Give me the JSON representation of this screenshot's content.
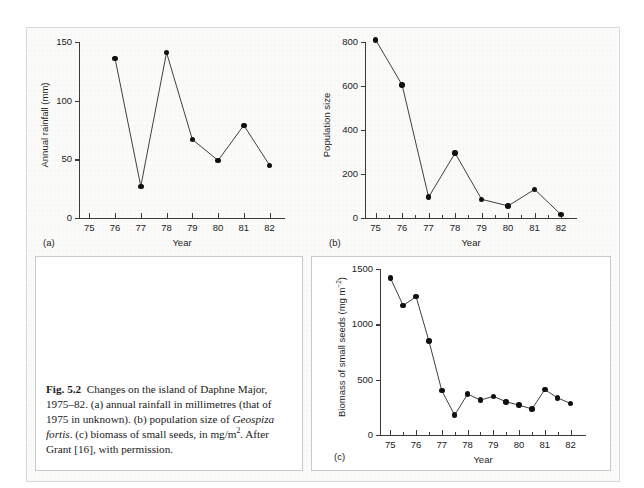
{
  "figure": {
    "label": "Fig. 5.2",
    "caption_segments": {
      "before_italic": "Changes on the island of Daphne Major, 1975–82. (a) annual rainfall in millimetres (that of 1975 in unknown). (b) population size of ",
      "italic": "Geospiza fortis",
      "after_italic_a": ". (c) biomass of small seeds, in mg/m",
      "superscript": "2",
      "after_italic_b": ". After Grant [16], with permission."
    }
  },
  "panels": {
    "a": {
      "letter": "(a)",
      "ylabel": "Annual rainfall (mm)",
      "xlabel": "Year"
    },
    "b": {
      "letter": "(b)",
      "ylabel": "Population size",
      "xlabel": "Year"
    },
    "c": {
      "letter": "(c)",
      "ylabel_text": "Biomass of small seeds (mg m",
      "ylabel_sup": "−2",
      "ylabel_tail": ")",
      "xlabel": "Year"
    }
  },
  "chart_data": [
    {
      "id": "panel-a",
      "type": "line",
      "title": "(a) Annual rainfall",
      "xlabel": "Year",
      "ylabel": "Annual rainfall (mm)",
      "xlim": [
        74.6,
        82.6
      ],
      "ylim": [
        0,
        150
      ],
      "yticks": [
        0,
        50,
        100,
        150
      ],
      "ytick_labels": [
        "0",
        "50",
        "100",
        "150"
      ],
      "xticks": [
        75,
        76,
        77,
        78,
        79,
        80,
        81,
        82
      ],
      "xtick_labels": [
        "75",
        "76",
        "77",
        "78",
        "79",
        "80",
        "81",
        "82"
      ],
      "minor_xticks": false,
      "grid": false,
      "legend": "none",
      "marker": "filled-circle",
      "note": "no data point for 1975 (unknown)",
      "x": [
        76,
        77,
        78,
        79,
        80,
        81,
        82
      ],
      "values": [
        136,
        27,
        141,
        67,
        49,
        79,
        45
      ]
    },
    {
      "id": "panel-b",
      "type": "line",
      "title": "(b) Population size of Geospiza fortis",
      "xlabel": "Year",
      "ylabel": "Population size",
      "xlim": [
        74.6,
        82.6
      ],
      "ylim": [
        0,
        800
      ],
      "yticks": [
        0,
        200,
        400,
        600,
        800
      ],
      "ytick_labels": [
        "0",
        "200",
        "400",
        "600",
        "800"
      ],
      "xticks": [
        75,
        76,
        77,
        78,
        79,
        80,
        81,
        82
      ],
      "xtick_labels": [
        "75",
        "76",
        "77",
        "78",
        "79",
        "80",
        "81",
        "82"
      ],
      "minor_xticks": true,
      "grid": false,
      "legend": "none",
      "marker": "filled-circle",
      "x": [
        75,
        76,
        77,
        78,
        79,
        80,
        81,
        82
      ],
      "values": [
        810,
        605,
        95,
        295,
        85,
        55,
        130,
        15
      ]
    },
    {
      "id": "panel-c",
      "type": "line",
      "title": "(c) Biomass of small seeds",
      "xlabel": "Year",
      "ylabel": "Biomass of small seeds (mg m−2)",
      "xlim": [
        74.6,
        82.6
      ],
      "ylim": [
        0,
        1500
      ],
      "yticks": [
        0,
        500,
        1000,
        1500
      ],
      "ytick_labels": [
        "0",
        "500",
        "1000",
        "1500"
      ],
      "xticks": [
        75,
        76,
        77,
        78,
        79,
        80,
        81,
        82
      ],
      "xtick_labels": [
        "75",
        "76",
        "77",
        "78",
        "79",
        "80",
        "81",
        "82"
      ],
      "minor_xticks": true,
      "grid": false,
      "legend": "none",
      "marker": "filled-circle",
      "x": [
        75,
        75.5,
        76,
        76.5,
        77,
        77.5,
        78,
        78.5,
        79,
        79.5,
        80,
        80.5,
        81,
        81.5,
        82
      ],
      "values": [
        1420,
        1170,
        1250,
        850,
        400,
        180,
        370,
        315,
        350,
        300,
        270,
        235,
        410,
        335,
        285
      ]
    }
  ]
}
